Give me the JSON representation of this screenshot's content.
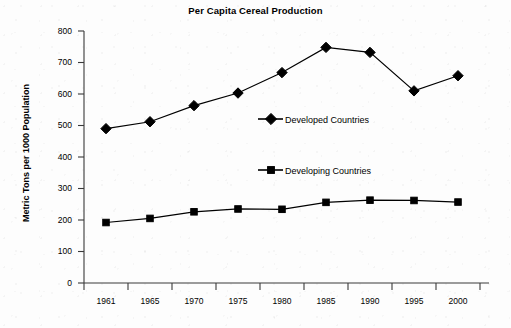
{
  "chart_data": {
    "type": "line",
    "title": "Per Capita Cereal Production",
    "xlabel": "",
    "ylabel": "Metric Tons per 1000 Population",
    "categories": [
      "1961",
      "1965",
      "1970",
      "1975",
      "1980",
      "1985",
      "1990",
      "1995",
      "2000"
    ],
    "ylim": [
      0,
      800
    ],
    "yticks": [
      "0",
      "100",
      "200",
      "300",
      "400",
      "500",
      "600",
      "700",
      "800"
    ],
    "grid": false,
    "legend_position": "inside-center",
    "series": [
      {
        "name": "Developed Countries",
        "marker": "diamond",
        "color": "#000000",
        "values": [
          490,
          512,
          563,
          603,
          668,
          748,
          732,
          610,
          658
        ]
      },
      {
        "name": "Developing Countries",
        "marker": "square",
        "color": "#000000",
        "values": [
          192,
          205,
          226,
          235,
          234,
          256,
          263,
          262,
          257
        ]
      }
    ]
  },
  "legend": {
    "items": [
      {
        "label": "Developed Countries",
        "marker": "diamond-marker"
      },
      {
        "label": "Developing Countries",
        "marker": "square-marker"
      }
    ]
  },
  "colors": {
    "ink": "#000000",
    "paper": "#fdfdfd",
    "axis": "#333333"
  }
}
